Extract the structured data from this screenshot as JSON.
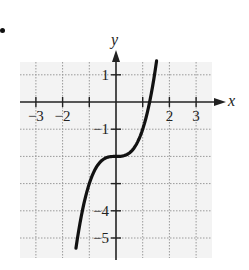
{
  "chart_data": {
    "type": "line",
    "function": "y = x^3 - 2",
    "title": "",
    "xlabel": "x",
    "ylabel": "y",
    "xlim": [
      -3.6,
      3.6
    ],
    "ylim": [
      -5.8,
      1.5
    ],
    "grid": true,
    "grid_style": "dotted",
    "x_ticks": [
      -3,
      -2,
      -1,
      1,
      2,
      3
    ],
    "x_tick_labels": [
      "−3",
      "−2",
      "",
      "",
      "2",
      "3"
    ],
    "y_ticks": [
      1,
      -1,
      -2,
      -3,
      -4,
      -5
    ],
    "y_tick_labels": [
      "1",
      "−1",
      "",
      "",
      "−4",
      "−5"
    ],
    "series": [
      {
        "name": "curve",
        "x": [
          -1.5,
          -1.25,
          -1.0,
          -0.75,
          -0.5,
          -0.25,
          0,
          0.25,
          0.5,
          0.75,
          1.0,
          1.25,
          1.5
        ],
        "y": [
          -5.375,
          -3.953,
          -3.0,
          -2.422,
          -2.125,
          -2.016,
          -2.0,
          -1.984,
          -1.875,
          -1.578,
          -1.0,
          -0.047,
          1.375
        ]
      }
    ],
    "key_points": {
      "inflection": [
        0,
        -2
      ],
      "x_intercept": 1.26
    }
  },
  "labels": {
    "x_axis": "x",
    "y_axis": "y"
  },
  "colors": {
    "curve": "#111111",
    "axis": "#222222",
    "grid": "#9a9a9a",
    "grid_bg": "#f3f3f3"
  }
}
